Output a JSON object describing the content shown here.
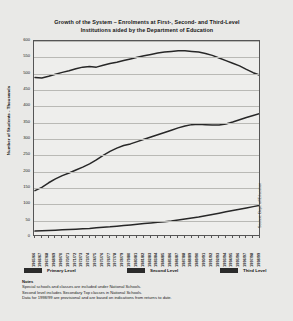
{
  "title": {
    "line1": "Growth of the System – Enrolments at First-, Second- and Third-Level",
    "line2": "Institutions aided by the Department of Education"
  },
  "legend": [
    {
      "label": "Primary Level",
      "color": "#2b2b2b"
    },
    {
      "label": "Second Level",
      "color": "#2b2b2b"
    },
    {
      "label": "Third Level",
      "color": "#2b2b2b"
    }
  ],
  "notes": {
    "heading": "Notes",
    "lines": [
      "Special schools and classes are included under National Schools.",
      "Second level includes Secondary Top classes in National Schools.",
      "Data for 1998/99 are provisional and are based on indications from returns to date."
    ]
  },
  "source": "Source: Dept. of Education",
  "chart_data": {
    "type": "line",
    "title": "Growth of the System – Enrolments at First-, Second- and Third-Level Institutions aided by the Department of Education",
    "xlabel": "",
    "ylabel": "Number of Students - Thousands",
    "ylim": [
      0,
      600
    ],
    "ytick_step": 50,
    "yticks": [
      0,
      50,
      100,
      150,
      200,
      250,
      300,
      350,
      400,
      450,
      500,
      550,
      600
    ],
    "grid": true,
    "legend_position": "bottom",
    "categories": [
      "1965/66",
      "1966/67",
      "1967/68",
      "1968/69",
      "1969/70",
      "1970/71",
      "1971/72",
      "1972/73",
      "1973/74",
      "1974/75",
      "1975/76",
      "1976/77",
      "1977/78",
      "1978/79",
      "1979/80",
      "1980/81",
      "1981/82",
      "1982/83",
      "1983/84",
      "1984/85",
      "1985/86",
      "1986/87",
      "1987/88",
      "1988/89",
      "1989/90",
      "1990/91",
      "1991/92",
      "1992/93",
      "1993/94",
      "1994/95",
      "1995/96",
      "1996/97",
      "1997/98",
      "1998/99"
    ],
    "series": [
      {
        "name": "Primary Level",
        "values": [
          488,
          487,
          492,
          498,
          504,
          509,
          515,
          520,
          522,
          520,
          526,
          531,
          535,
          540,
          545,
          550,
          555,
          559,
          563,
          566,
          568,
          570,
          570,
          568,
          566,
          562,
          556,
          548,
          540,
          532,
          524,
          513,
          503,
          495
        ]
      },
      {
        "name": "Second Level",
        "values": [
          142,
          152,
          166,
          178,
          188,
          196,
          205,
          214,
          224,
          236,
          250,
          262,
          272,
          280,
          285,
          292,
          299,
          306,
          313,
          320,
          327,
          334,
          340,
          344,
          345,
          344,
          343,
          343,
          346,
          352,
          359,
          366,
          372,
          378
        ]
      },
      {
        "name": "Third Level",
        "values": [
          18,
          19,
          20,
          21,
          22,
          23,
          24,
          25,
          26,
          28,
          30,
          31,
          33,
          35,
          37,
          39,
          41,
          43,
          45,
          47,
          49,
          52,
          55,
          58,
          61,
          65,
          69,
          73,
          77,
          81,
          85,
          89,
          93,
          97
        ]
      }
    ]
  }
}
